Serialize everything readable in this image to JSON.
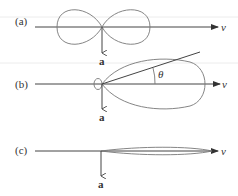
{
  "diagram": {
    "panels": [
      {
        "id": "a",
        "label": "(a)",
        "velocity_label": "v",
        "acceleration_label": "a",
        "pattern": "dipole-figure-eight"
      },
      {
        "id": "b",
        "label": "(b)",
        "velocity_label": "v",
        "acceleration_label": "a",
        "angle_label": "θ",
        "pattern": "forward-beamed-lobe"
      },
      {
        "id": "c",
        "label": "(c)",
        "velocity_label": "v",
        "acceleration_label": "a",
        "pattern": "narrow-forward-beam"
      }
    ]
  },
  "colors": {
    "axis": "#444444",
    "lobe": "#777777",
    "background": "#ffffff"
  }
}
